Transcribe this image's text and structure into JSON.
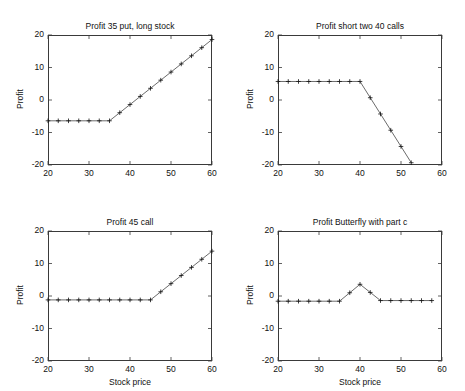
{
  "figure": {
    "background_color": "#ffffff",
    "line_color": "#2b2b2b",
    "axis_color": "#3a3a3a",
    "marker_symbol": "+",
    "layout": "2x2 subplots"
  },
  "chart_data": [
    {
      "type": "line",
      "id": "profit-35-put-long-stock",
      "title": "Profit 35 put, long stock",
      "xlabel": "",
      "ylabel": "Profit",
      "xlim": [
        20,
        60
      ],
      "ylim": [
        -20,
        20
      ],
      "xticks": [
        20,
        30,
        40,
        50,
        60
      ],
      "yticks": [
        -20,
        -10,
        0,
        10,
        20
      ],
      "xtick_labels": [
        "20",
        "30",
        "40",
        "50",
        "60"
      ],
      "ytick_labels": [
        "-20",
        "-10",
        "0",
        "10",
        "20"
      ],
      "grid": false,
      "legend": null,
      "marker": "+",
      "x": [
        20,
        22.5,
        25,
        27.5,
        30,
        32.5,
        35,
        37.5,
        40,
        42.5,
        45,
        47.5,
        50,
        52.5,
        55,
        57.5,
        60
      ],
      "values": [
        -6.4,
        -6.4,
        -6.4,
        -6.4,
        -6.4,
        -6.4,
        -6.4,
        -3.9,
        -1.4,
        1.1,
        3.6,
        6.1,
        8.6,
        11.1,
        13.6,
        16.1,
        18.6
      ]
    },
    {
      "type": "line",
      "id": "profit-short-two-40-calls",
      "title": "Profit short two 40 calls",
      "xlabel": "",
      "ylabel": "Profit",
      "xlim": [
        20,
        60
      ],
      "ylim": [
        -20,
        20
      ],
      "xticks": [
        20,
        30,
        40,
        50,
        60
      ],
      "yticks": [
        -20,
        -10,
        0,
        10,
        20
      ],
      "xtick_labels": [
        "20",
        "30",
        "40",
        "50",
        "60"
      ],
      "ytick_labels": [
        "-20",
        "-10",
        "0",
        "10",
        "20"
      ],
      "grid": false,
      "legend": null,
      "marker": "+",
      "x": [
        20,
        22.5,
        25,
        27.5,
        30,
        32.5,
        35,
        37.5,
        40,
        42.5,
        45,
        47.5,
        50,
        52.5
      ],
      "values": [
        5.7,
        5.7,
        5.7,
        5.7,
        5.7,
        5.7,
        5.7,
        5.7,
        5.7,
        0.7,
        -4.3,
        -9.3,
        -14.3,
        -19.3
      ]
    },
    {
      "type": "line",
      "id": "profit-45-call",
      "title": "Profit 45 call",
      "xlabel": "Stock price",
      "ylabel": "Profit",
      "xlim": [
        20,
        60
      ],
      "ylim": [
        -20,
        20
      ],
      "xticks": [
        20,
        30,
        40,
        50,
        60
      ],
      "yticks": [
        -20,
        -10,
        0,
        10,
        20
      ],
      "xtick_labels": [
        "20",
        "30",
        "40",
        "50",
        "60"
      ],
      "ytick_labels": [
        "-20",
        "-10",
        "0",
        "10",
        "20"
      ],
      "grid": false,
      "legend": null,
      "marker": "+",
      "x": [
        20,
        22.5,
        25,
        27.5,
        30,
        32.5,
        35,
        37.5,
        40,
        42.5,
        45,
        47.5,
        50,
        52.5,
        55,
        57.5,
        60
      ],
      "values": [
        -1.2,
        -1.2,
        -1.2,
        -1.2,
        -1.2,
        -1.2,
        -1.2,
        -1.2,
        -1.2,
        -1.2,
        -1.2,
        1.3,
        3.8,
        6.3,
        8.8,
        11.3,
        13.8
      ]
    },
    {
      "type": "line",
      "id": "profit-butterfly-with-part-c",
      "title": "Profit Butterfly with part c",
      "xlabel": "Stock price",
      "ylabel": "Profit",
      "xlim": [
        20,
        60
      ],
      "ylim": [
        -20,
        20
      ],
      "xticks": [
        20,
        30,
        40,
        50,
        60
      ],
      "yticks": [
        -20,
        -10,
        0,
        10,
        20
      ],
      "xtick_labels": [
        "20",
        "30",
        "40",
        "50",
        "60"
      ],
      "ytick_labels": [
        "-20",
        "-10",
        "0",
        "10",
        "20"
      ],
      "grid": false,
      "legend": null,
      "marker": "+",
      "x": [
        20,
        22.5,
        25,
        27.5,
        30,
        32.5,
        35,
        37.5,
        40,
        42.5,
        45,
        47.5,
        50,
        52.5,
        55,
        57.5
      ],
      "values": [
        -1.6,
        -1.6,
        -1.6,
        -1.6,
        -1.6,
        -1.6,
        -1.6,
        1.0,
        3.6,
        1.1,
        -1.4,
        -1.4,
        -1.4,
        -1.4,
        -1.4,
        -1.4
      ]
    }
  ]
}
